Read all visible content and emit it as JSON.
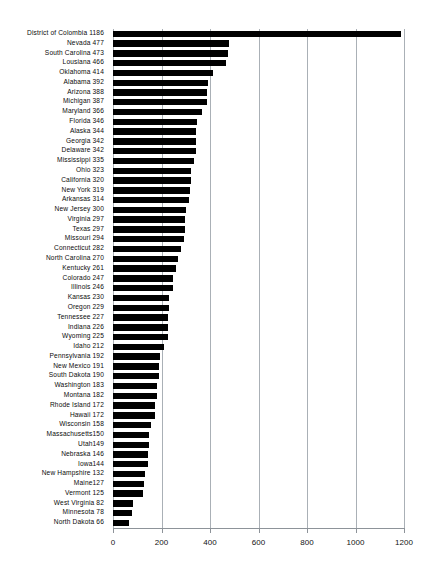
{
  "chart_data": {
    "type": "bar",
    "orientation": "horizontal",
    "title": "",
    "xlabel": "",
    "ylabel": "",
    "xlim": [
      0,
      1200
    ],
    "xticks": [
      0,
      200,
      400,
      600,
      800,
      1000,
      1200
    ],
    "xtick_labels": [
      "0",
      "200",
      "400",
      "600",
      "800",
      "1000",
      "1200"
    ],
    "grid": true,
    "grid_axis": "x",
    "legend": false,
    "bar_color": "#000000",
    "grid_color": "#aab0b6",
    "categories": [
      "District of Colombia",
      "Nevada",
      "South Carolina",
      "Lousiana",
      "Oklahoma",
      "Alabama",
      "Arizona",
      "Michigan",
      "Maryland",
      "Florida",
      "Alaska",
      "Georgia",
      "Delaware",
      "Mississippi",
      "Ohio",
      "California",
      "New York",
      "Arkansas",
      "New Jersey",
      "Virginia",
      "Texas",
      "Missouri",
      "Connecticut",
      "North Carolina",
      "Kentucky",
      "Colorado",
      "Illinois",
      "Kansas",
      "Oregon",
      "Tennessee",
      "Indiana",
      "Wyoming",
      "Idaho",
      "Pennsylvania",
      "New Mexico",
      "South Dakota",
      "Washington",
      "Montana",
      "Rhode Island",
      "Hawaii",
      "Wisconsin",
      "Massachusetts",
      "Utah",
      "Nebraska",
      "Iowa",
      "New Hampshire",
      "Maine",
      "Vermont",
      "West Virginia",
      "Minnesota",
      "North Dakota"
    ],
    "values": [
      1186,
      477,
      473,
      466,
      414,
      392,
      388,
      387,
      366,
      346,
      344,
      342,
      342,
      335,
      323,
      320,
      319,
      314,
      300,
      297,
      297,
      294,
      282,
      270,
      261,
      247,
      246,
      230,
      229,
      227,
      226,
      225,
      212,
      192,
      191,
      190,
      183,
      182,
      172,
      172,
      158,
      150,
      149,
      146,
      144,
      132,
      127,
      125,
      82,
      78,
      66
    ],
    "row_labels": [
      "District of Colombia 1186",
      "Nevada 477",
      "South Carolina 473",
      "Lousiana 466",
      "Oklahoma 414",
      "Alabama 392",
      "Arizona 388",
      "Michigan 387",
      "Maryland 366",
      "Florida 346",
      "Alaska 344",
      "Georgia 342",
      "Delaware 342",
      "Mississippi 335",
      "Ohio 323",
      "California 320",
      "New York 319",
      "Arkansas 314",
      "New Jersey 300",
      "Virginia 297",
      "Texas 297",
      "Missouri 294",
      "Connecticut 282",
      "North Carolina 270",
      "Kentucky 261",
      "Colorado 247",
      "Illinois 246",
      "Kansas 230",
      "Oregon 229",
      "Tennessee 227",
      "Indiana 226",
      "Wyoming 225",
      "Idaho 212",
      "Pennsylvania 192",
      "New Mexico 191",
      "South Dakota 190",
      "Washington 183",
      "Montana 182",
      "Rhode Island 172",
      "Hawaii 172",
      "Wisconsin 158",
      "Massachusetts150",
      "Utah149",
      "Nebraska 146",
      "Iowa144",
      "New Hampshire 132",
      "Maine127",
      "Vermont 125",
      "West Virginia 82",
      "Minnesota 78",
      "North Dakota 66"
    ]
  }
}
